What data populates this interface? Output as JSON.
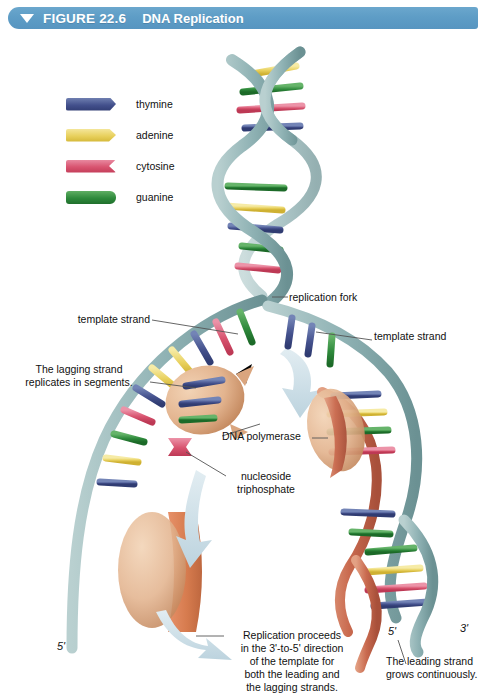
{
  "header": {
    "figure_number": "FIGURE 22.6",
    "title": "DNA Replication",
    "banner_color": "#5e9dc6",
    "triangle_icon": "triangle-down-icon"
  },
  "legend": {
    "items": [
      {
        "label": "thymine",
        "color": "#43508c",
        "shape": "notched-right"
      },
      {
        "label": "adenine",
        "color": "#e8d05c",
        "shape": "pointed-right"
      },
      {
        "label": "cytosine",
        "color": "#d8536f",
        "shape": "concave-right"
      },
      {
        "label": "guanine",
        "color": "#2f8a3c",
        "shape": "rounded-right"
      }
    ]
  },
  "annotations": {
    "replication_fork": "replication fork",
    "template_strand_left": "template strand",
    "template_strand_right": "template strand",
    "lagging_strand_note": "The lagging strand\nreplicates in segments.",
    "lagging_strand_line1": "The lagging strand",
    "lagging_strand_line2": "replicates in segments.",
    "dna_polymerase": "DNA polymerase",
    "nucleoside_line1": "nucleoside",
    "nucleoside_line2": "triphosphate",
    "replication_note_line1": "Replication proceeds",
    "replication_note_line2": "in the 3'-to-5' direction",
    "replication_note_line3": "of the template for",
    "replication_note_line4": "both the leading and",
    "replication_note_line5": "the lagging strands.",
    "leading_strand_line1": "The leading strand",
    "leading_strand_line2": "grows continuously."
  },
  "end_labels": {
    "bottom_left_5prime": "5'",
    "bottom_right_5prime": "5'",
    "bottom_right_3prime": "3'"
  },
  "colors": {
    "template_backbone": "#8fb2b4",
    "template_backbone_dark": "#6d9597",
    "new_strand": "#c96a4f",
    "new_strand_light": "#e09070",
    "polymerase": "#e3b48f",
    "polymerase_dark": "#c9916a",
    "arrow": "#cfdfe6",
    "leader_line": "#555555",
    "background": "#ffffff"
  }
}
